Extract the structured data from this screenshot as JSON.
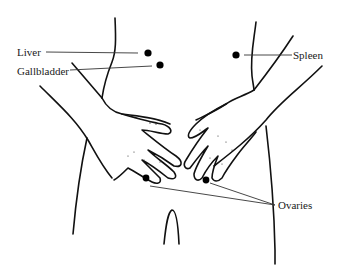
{
  "diagram": {
    "type": "anatomical-illustration",
    "labels": [
      {
        "id": "liver",
        "text": "Liver",
        "side": "left"
      },
      {
        "id": "gallbladder",
        "text": "Gallbladder",
        "side": "left"
      },
      {
        "id": "spleen",
        "text": "Spleen",
        "side": "right"
      },
      {
        "id": "ovaries",
        "text": "Ovaries",
        "side": "right"
      }
    ],
    "markers": [
      {
        "organ": "Liver",
        "x": 148,
        "y": 53
      },
      {
        "organ": "Gallbladder",
        "x": 160,
        "y": 65
      },
      {
        "organ": "Spleen",
        "x": 236,
        "y": 55
      },
      {
        "organ": "Ovaries (left)",
        "x": 146,
        "y": 178
      },
      {
        "organ": "Ovaries (right)",
        "x": 206,
        "y": 180
      }
    ],
    "colors": {
      "line": "#111111",
      "marker": "#000000",
      "background": "#ffffff"
    }
  }
}
